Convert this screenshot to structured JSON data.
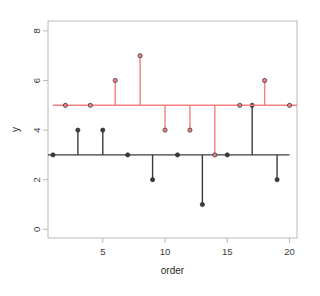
{
  "chart_data": {
    "type": "line",
    "title": "",
    "xlabel": "order",
    "ylabel": "y",
    "xlim": [
      0.6,
      20.6
    ],
    "ylim": [
      -0.35,
      8.4
    ],
    "xticks": [
      5,
      10,
      15,
      20
    ],
    "yticks": [
      0,
      2,
      4,
      6,
      8
    ],
    "grid": false,
    "legend": null,
    "style": "stem-plot with horizontal baseline per series",
    "series": [
      {
        "name": "black-series",
        "color": "#3b3b3b",
        "baseline": 3,
        "x": [
          1,
          3,
          5,
          7,
          9,
          11,
          13,
          15,
          17,
          19
        ],
        "values": [
          3,
          4,
          4,
          3,
          2,
          3,
          1,
          3,
          5,
          2
        ]
      },
      {
        "name": "red-series",
        "color": "#f08080",
        "baseline": 5,
        "x": [
          2,
          4,
          6,
          8,
          10,
          12,
          14,
          16,
          18,
          20
        ],
        "values": [
          5,
          5,
          6,
          7,
          4,
          4,
          3,
          5,
          6,
          5
        ]
      }
    ]
  },
  "axes": {
    "x_tick_labels": [
      "5",
      "10",
      "15",
      "20"
    ],
    "y_tick_labels": [
      "0",
      "2",
      "4",
      "6",
      "8"
    ],
    "x_axis_title": "order",
    "y_axis_title": "y"
  },
  "colors": {
    "black_series": "#3b3b3b",
    "red_series": "#f08080",
    "frame": "#b9b9b9",
    "axis_text": "#3a3a3a",
    "background": "#ffffff"
  }
}
